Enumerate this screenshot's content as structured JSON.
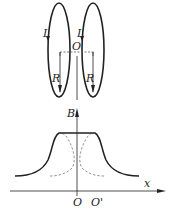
{
  "figure": {
    "type": "helmholtz-coils-field-diagram",
    "colors": {
      "stroke": "#222222",
      "dashed": "#888888",
      "background": "#ffffff"
    },
    "coils": {
      "left": {
        "current_label": "I",
        "radius_label": "R"
      },
      "right": {
        "current_label": "I",
        "radius_label": "R"
      },
      "center_label": "O"
    },
    "graph": {
      "y_axis_label": "B",
      "x_axis_label": "x",
      "origin_label": "O",
      "second_center_label": "O'",
      "curves": [
        {
          "name": "total-field",
          "style": "solid"
        },
        {
          "name": "left-coil-field",
          "style": "dashed"
        },
        {
          "name": "right-coil-field",
          "style": "dashed"
        }
      ]
    }
  }
}
